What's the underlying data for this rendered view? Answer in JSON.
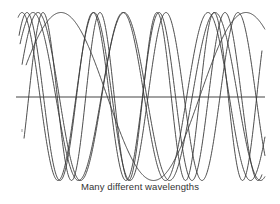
{
  "figure": {
    "caption": "Many different wavelengths",
    "stroke_color": "#3a3a3a",
    "axis_color": "#444444"
  },
  "chart_data": {
    "type": "line",
    "title": "",
    "caption": "Many different wavelengths",
    "xlabel": "",
    "ylabel": "",
    "grid": false,
    "legend": null,
    "axis": {
      "y_pixel": 97,
      "x_start": 16,
      "x_end": 265
    },
    "amplitude_px": 84,
    "midline_px": 96.5,
    "series": [
      {
        "name": "wave-1",
        "peak_x": 22,
        "wavelength_px": 72,
        "x_start": 18,
        "x_end": 265
      },
      {
        "name": "wave-2",
        "peak_x": 27,
        "wavelength_px": 66,
        "x_start": 19,
        "x_end": 262
      },
      {
        "name": "wave-3",
        "peak_x": 33,
        "wavelength_px": 91,
        "x_start": 20,
        "x_end": 265
      },
      {
        "name": "wave-4",
        "peak_x": 38,
        "wavelength_px": 85,
        "x_start": 22,
        "x_end": 265
      },
      {
        "name": "wave-5",
        "peak_x": 43,
        "wavelength_px": 57,
        "x_start": 24,
        "x_end": 262
      },
      {
        "name": "wave-6",
        "peak_x": 61,
        "wavelength_px": 185,
        "x_start": 26,
        "x_end": 265
      }
    ]
  }
}
